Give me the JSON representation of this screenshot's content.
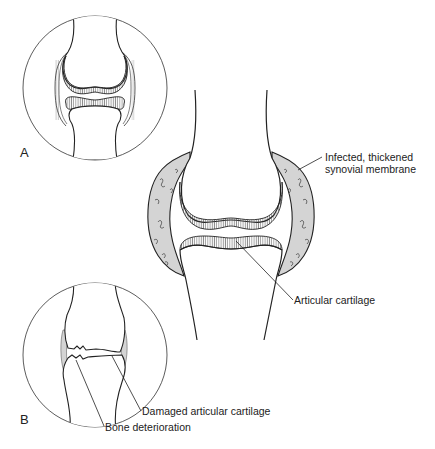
{
  "figure": {
    "type": "medical-illustration",
    "panels": [
      {
        "id": "A",
        "label": "A",
        "description": "Normal joint with intact articular cartilage"
      },
      {
        "id": "center",
        "label": "",
        "description": "Joint with inflamed synovial membrane"
      },
      {
        "id": "B",
        "label": "B",
        "description": "Joint with damaged cartilage and bone deterioration"
      }
    ],
    "labels": {
      "synovial_line1": "Infected, thickened",
      "synovial_line2": "synovial membrane",
      "articular_cartilage": "Articular cartilage",
      "damaged_cartilage": "Damaged articular cartilage",
      "bone_deterioration": "Bone deterioration"
    }
  },
  "colors": {
    "line": "#222222",
    "membrane_fill": "#d4d4d4",
    "background": "#ffffff"
  }
}
